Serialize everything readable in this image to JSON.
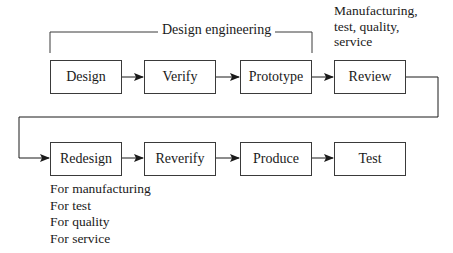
{
  "diagram": {
    "type": "process-flow",
    "bracket": {
      "label": "Design engineering"
    },
    "review_note": [
      "Manufacturing,",
      "test, quality,",
      "service"
    ],
    "row1": [
      {
        "id": "design",
        "label": "Design"
      },
      {
        "id": "verify",
        "label": "Verify"
      },
      {
        "id": "prototype",
        "label": "Prototype"
      },
      {
        "id": "review",
        "label": "Review"
      }
    ],
    "row2": [
      {
        "id": "redesign",
        "label": "Redesign"
      },
      {
        "id": "reverify",
        "label": "Reverify"
      },
      {
        "id": "produce",
        "label": "Produce"
      },
      {
        "id": "test",
        "label": "Test"
      }
    ],
    "redesign_notes": [
      "For manufacturing",
      "For test",
      "For quality",
      "For service"
    ],
    "edges": [
      [
        "design",
        "verify"
      ],
      [
        "verify",
        "prototype"
      ],
      [
        "prototype",
        "review"
      ],
      [
        "review",
        "redesign"
      ],
      [
        "redesign",
        "reverify"
      ],
      [
        "reverify",
        "produce"
      ],
      [
        "produce",
        "test"
      ]
    ],
    "colors": {
      "line": "#3a3a3a",
      "text": "#1a1a1a",
      "background": "#ffffff"
    }
  }
}
